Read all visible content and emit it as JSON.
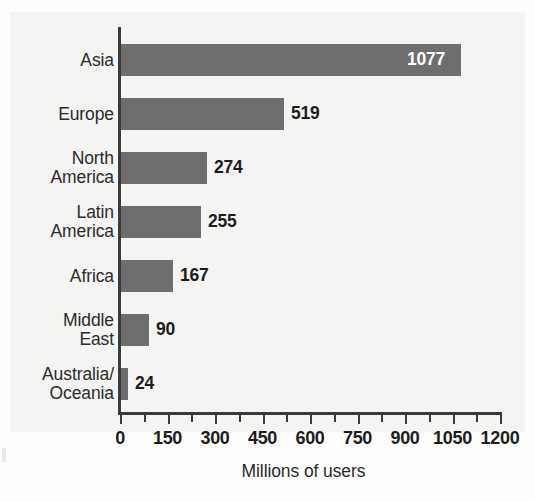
{
  "chart_data": {
    "type": "bar",
    "orientation": "horizontal",
    "title": "",
    "xlabel": "Millions of users",
    "ylabel": "",
    "categories": [
      "Asia",
      "Europe",
      "North\nAmerica",
      "Latin\nAmerica",
      "Africa",
      "Middle\nEast",
      "Australia/\nOceania"
    ],
    "values": [
      1077,
      519,
      274,
      255,
      167,
      90,
      24
    ],
    "value_labels": [
      "1077",
      "519",
      "274",
      "255",
      "167",
      "90",
      "24"
    ],
    "xlim": [
      0,
      1200
    ],
    "xticks": [
      0,
      150,
      300,
      450,
      600,
      750,
      900,
      1050,
      1200
    ],
    "xtick_labels": [
      "0",
      "150",
      "300",
      "450",
      "600",
      "750",
      "900",
      "1050",
      "1200"
    ],
    "minor_tick_interval": 75,
    "grid": false,
    "legend": null,
    "bar_color": "#6e6e6e",
    "background_color": "#f4f4f2",
    "axis_color": "#3a3a3a",
    "label_inside_color": "#ffffff",
    "label_outside_color": "#1c1c1c",
    "labels_inside_bar": [
      true,
      false,
      false,
      false,
      false,
      false,
      false
    ]
  },
  "axis": {
    "x_title": "Millions of users"
  }
}
